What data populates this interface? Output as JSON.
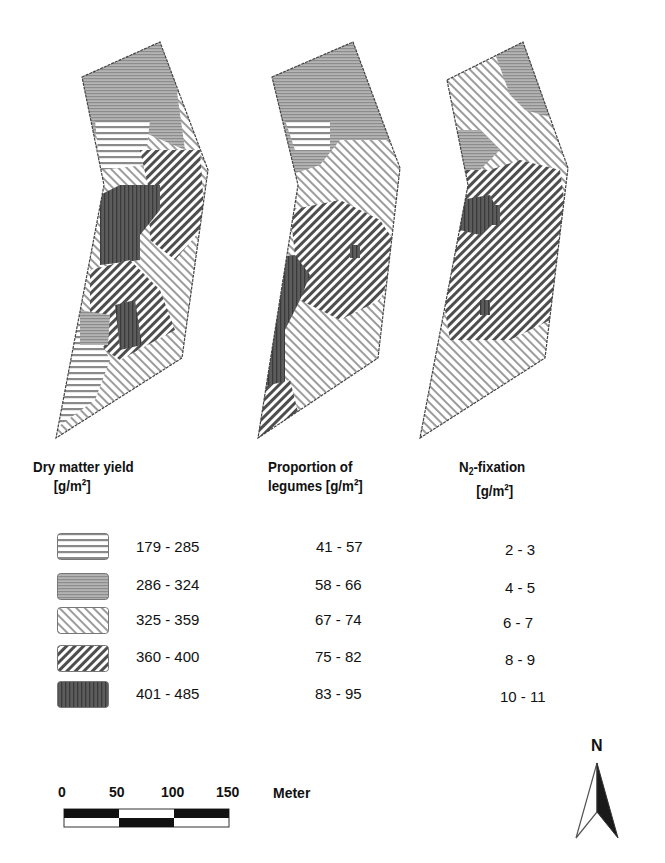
{
  "maps": [
    {
      "id": "dry-matter-yield-map",
      "title": "Dry matter yield",
      "unit": "[g/m²]"
    },
    {
      "id": "legume-proportion-map",
      "title": "Proportion of",
      "title_line2": "legumes [g/m²]"
    },
    {
      "id": "n2-fixation-map",
      "title_prefix": "N",
      "title_sub": "2",
      "title_suffix": "-fixation",
      "unit": "[g/m²]"
    }
  ],
  "legend": {
    "classes": [
      {
        "pattern": "horizontal-lines-white",
        "dry_matter": "179 - 285",
        "legumes": "41 - 57",
        "n2": "2 - 3"
      },
      {
        "pattern": "fine-horizontal-gray",
        "dry_matter": "286 - 324",
        "legumes": "58 - 66",
        "n2": "4 - 5"
      },
      {
        "pattern": "light-diagonal-forward",
        "dry_matter": "325 - 359",
        "legumes": "67 - 74",
        "n2": "6 - 7"
      },
      {
        "pattern": "dark-diagonal-backward",
        "dry_matter": "360 - 400",
        "legumes": "75 - 82",
        "n2": "8 - 9"
      },
      {
        "pattern": "dark-vertical",
        "dry_matter": "401 - 485",
        "legumes": "83 - 95",
        "n2": "10 - 11"
      }
    ]
  },
  "scale_bar": {
    "ticks": [
      "0",
      "50",
      "100",
      "150"
    ],
    "unit": "Meter"
  },
  "north_arrow": {
    "label": "N"
  },
  "colors": {
    "dark_fill": "#555555",
    "mid_gray": "#9a9a9a",
    "line": "#333333"
  }
}
